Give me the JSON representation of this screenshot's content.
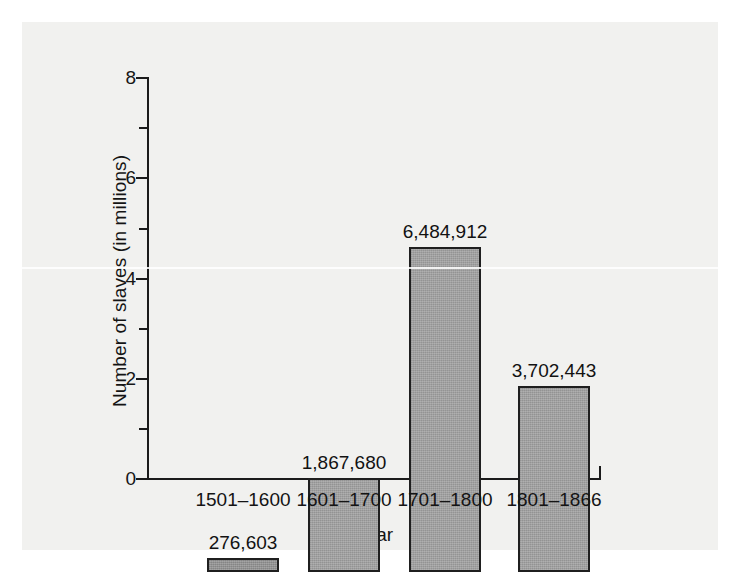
{
  "chart_data": {
    "type": "bar",
    "title": "",
    "xlabel": "Year",
    "ylabel": "Number of slaves (in millions)",
    "categories": [
      "1501–1600",
      "1601–1700",
      "1701–1800",
      "1801–1866"
    ],
    "values": [
      0.276603,
      1.86768,
      6.484912,
      3.702443
    ],
    "value_labels": [
      "276,603",
      "1,867,680",
      "6,484,912",
      "3,702,443"
    ],
    "ylim": [
      0,
      8
    ],
    "y_major_ticks": [
      0,
      2,
      4,
      6,
      8
    ],
    "y_major_tick_labels": [
      "0",
      "2",
      "4",
      "6",
      "8"
    ],
    "y_minor_ticks": [
      1,
      3,
      5,
      7
    ],
    "grid": false,
    "legend": "none",
    "bar_color": "#9b9b9b",
    "bar_edge_color": "#1f1f1f",
    "axis_color": "#1b1b1b",
    "background_color": "#f1f1ef"
  },
  "axes": {
    "y_title": "Number of slaves (in millions)",
    "x_title": "Year"
  },
  "bars": [
    {
      "category": "1501–1600",
      "label": "276,603",
      "value": 0.276603
    },
    {
      "category": "1601–1700",
      "label": "1,867,680",
      "value": 1.86768
    },
    {
      "category": "1701–1800",
      "label": "6,484,912",
      "value": 6.484912
    },
    {
      "category": "1801–1866",
      "label": "3,702,443",
      "value": 3.702443
    }
  ],
  "y_ticks": [
    {
      "label": "8",
      "value": 8
    },
    {
      "label": "6",
      "value": 6
    },
    {
      "label": "4",
      "value": 4
    },
    {
      "label": "2",
      "value": 2
    },
    {
      "label": "0",
      "value": 0
    }
  ]
}
